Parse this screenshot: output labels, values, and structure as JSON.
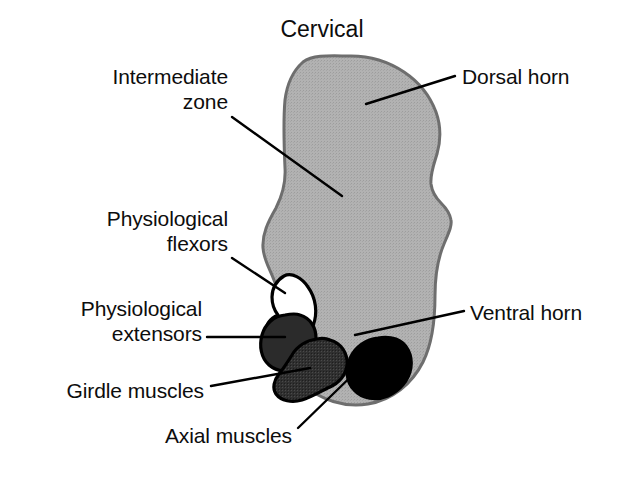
{
  "figure": {
    "title": "Cervical",
    "title_pos": {
      "x": 247,
      "y": 16,
      "w": 150
    },
    "background": "#ffffff",
    "text_color": "#0d0d0d",
    "leader_color": "#000000"
  },
  "colors": {
    "gray_matter_fill": "#b0b0b0",
    "gray_matter_stroke": "#6e6e6e",
    "flexors_fill": "#ffffff",
    "flexors_stroke": "#000000",
    "extensors_fill": "#2b2b2b",
    "extensors_stroke": "#000000",
    "girdle_fill": "#353535",
    "girdle_stroke": "#000000",
    "axial_fill": "#000000",
    "axial_stroke": "#000000",
    "leader_line": "#000000"
  },
  "labels": [
    {
      "id": "intermediate-zone",
      "text_lines": [
        "Intermediate",
        "zone"
      ],
      "align": "right",
      "x": 60,
      "y": 64,
      "w": 168,
      "leader": {
        "x1": 232,
        "y1": 117,
        "x2": 342,
        "y2": 196
      }
    },
    {
      "id": "physiological-flexors",
      "text_lines": [
        "Physiological",
        "flexors"
      ],
      "align": "right",
      "x": 56,
      "y": 206,
      "w": 172,
      "leader": {
        "x1": 232,
        "y1": 258,
        "x2": 285,
        "y2": 293
      }
    },
    {
      "id": "physiological-extensors",
      "text_lines": [
        "Physiological",
        "extensors"
      ],
      "align": "right",
      "x": 27,
      "y": 296,
      "w": 175,
      "leader": {
        "x1": 207,
        "y1": 337,
        "x2": 285,
        "y2": 337
      }
    },
    {
      "id": "girdle-muscles",
      "text_lines": [
        "Girdle muscles"
      ],
      "align": "right",
      "x": 24,
      "y": 378,
      "w": 180,
      "leader": {
        "x1": 211,
        "y1": 386,
        "x2": 310,
        "y2": 368
      }
    },
    {
      "id": "axial-muscles",
      "text_lines": [
        "Axial muscles"
      ],
      "align": "right",
      "x": 122,
      "y": 423,
      "w": 170,
      "leader": {
        "x1": 298,
        "y1": 428,
        "x2": 366,
        "y2": 362
      }
    },
    {
      "id": "dorsal-horn",
      "text_lines": [
        "Dorsal horn"
      ],
      "align": "left",
      "x": 462,
      "y": 64,
      "w": 160,
      "leader": {
        "x1": 455,
        "y1": 76,
        "x2": 366,
        "y2": 104
      }
    },
    {
      "id": "ventral-horn",
      "text_lines": [
        "Ventral horn"
      ],
      "align": "left",
      "x": 470,
      "y": 300,
      "w": 160,
      "leader": {
        "x1": 464,
        "y1": 311,
        "x2": 355,
        "y2": 335
      }
    }
  ],
  "shapes": {
    "gray_matter": {
      "name": "spinal-cord-gray-matter",
      "path": "M 303 62 C 294 70, 287 84, 285 100 C 283 122, 284 146, 285 168 C 286 184, 282 196, 276 208 C 268 222, 262 234, 263 248 C 264 262, 272 272, 276 286 C 280 300, 276 314, 278 330 C 280 350, 288 370, 303 384 C 320 400, 345 408, 368 404 C 392 400, 412 384, 423 362 C 433 342, 435 318, 435 296 C 435 276, 438 258, 444 244 C 449 232, 452 226, 451 220 C 450 213, 446 208, 441 203 C 436 198, 432 192, 431 184 C 430 174, 434 164, 437 154 C 441 140, 441 126, 436 112 C 430 96, 419 82, 404 72 C 389 62, 370 56, 351 56 C 333 56, 314 54, 303 62 Z"
    },
    "nuclei": [
      {
        "name": "physiological-flexors-nucleus",
        "fill_key": "flexors_fill",
        "path": "M 284 276 C 277 280, 272 288, 272 297 C 272 304, 274 310, 278 315 C 271 318, 266 324, 266 332 C 266 341, 274 348, 284 348 C 296 348, 308 339, 313 326 C 318 313, 316 298, 308 287 C 302 278, 292 272, 284 276 Z"
      },
      {
        "name": "physiological-extensors-nucleus",
        "fill_key": "extensors_fill",
        "path": "M 285 315 C 274 316, 265 324, 262 335 C 259 346, 261 358, 269 365 C 277 372, 290 373, 300 367 C 310 361, 316 350, 316 338 C 316 327, 310 318, 300 315 C 295 313, 290 314, 285 315 Z"
      },
      {
        "name": "girdle-muscles-nucleus",
        "fill_key": "girdle_fill",
        "path": "M 317 339 C 307 340, 297 346, 292 355 C 287 363, 283 369, 279 374 C 274 380, 272 388, 276 394 C 281 401, 292 403, 302 400 C 312 397, 321 391, 330 387 C 339 383, 346 375, 347 365 C 348 353, 341 343, 330 340 C 326 338, 321 338, 317 339 Z"
      },
      {
        "name": "axial-muscles-nucleus",
        "fill_key": "axial_fill",
        "path": "M 378 338 C 366 339, 355 347, 350 358 C 345 369, 346 382, 354 390 C 362 399, 376 401, 388 396 C 400 391, 409 380, 411 368 C 413 355, 407 343, 396 339 C 390 337, 384 337, 378 338 Z"
      }
    ]
  }
}
